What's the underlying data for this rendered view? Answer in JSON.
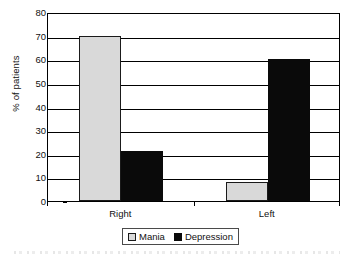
{
  "chart_data": {
    "type": "bar",
    "title": "",
    "xlabel": "",
    "ylabel": "% of patients",
    "categories": [
      "Right",
      "Left"
    ],
    "series": [
      {
        "name": "Mania",
        "values": [
          70,
          8
        ],
        "color": "#d9d9d9"
      },
      {
        "name": "Depression",
        "values": [
          21,
          60
        ],
        "color": "#0a0a0a"
      }
    ],
    "ylim": [
      0,
      80
    ],
    "ytick_values": [
      0,
      10,
      20,
      30,
      40,
      50,
      60,
      70,
      80
    ],
    "ytick_labels": [
      "0",
      "10",
      "20",
      "30",
      "40",
      "50",
      "60",
      "70",
      "80"
    ],
    "grid": "horizontal",
    "legend_position": "bottom-center",
    "frame": true
  },
  "legend": {
    "entries": [
      {
        "label": "Mania",
        "swatch": "mania"
      },
      {
        "label": "Depression",
        "swatch": "depression"
      }
    ]
  }
}
